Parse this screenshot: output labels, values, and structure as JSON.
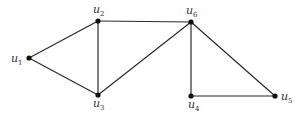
{
  "diagram": {
    "type": "undirected-graph",
    "nodes": [
      {
        "id": "u1",
        "base": "u",
        "sub": "1",
        "x": 29,
        "y": 58,
        "lx": 11,
        "ly": 62
      },
      {
        "id": "u2",
        "base": "u",
        "sub": "2",
        "x": 98,
        "y": 21,
        "lx": 93,
        "ly": 13
      },
      {
        "id": "u3",
        "base": "u",
        "sub": "3",
        "x": 98,
        "y": 95,
        "lx": 93,
        "ly": 107
      },
      {
        "id": "u4",
        "base": "u",
        "sub": "4",
        "x": 191,
        "y": 96,
        "lx": 188,
        "ly": 108
      },
      {
        "id": "u5",
        "base": "u",
        "sub": "5",
        "x": 275,
        "y": 96,
        "lx": 281,
        "ly": 100
      },
      {
        "id": "u6",
        "base": "u",
        "sub": "6",
        "x": 191,
        "y": 22,
        "lx": 186,
        "ly": 14
      }
    ],
    "edges": [
      [
        "u1",
        "u2"
      ],
      [
        "u1",
        "u3"
      ],
      [
        "u2",
        "u3"
      ],
      [
        "u2",
        "u6"
      ],
      [
        "u3",
        "u6"
      ],
      [
        "u6",
        "u4"
      ],
      [
        "u6",
        "u5"
      ],
      [
        "u4",
        "u5"
      ]
    ],
    "colors": {
      "edge": "#2a2a2a",
      "node": "#111111",
      "label": "#333333"
    }
  }
}
